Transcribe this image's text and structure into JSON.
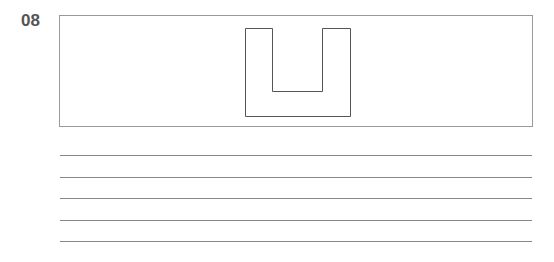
{
  "question": {
    "number": "08"
  },
  "figure": {
    "shape": "u-shape-outline",
    "stroke": "#555555"
  },
  "answer_lines": {
    "count": 5,
    "color": "#888888"
  }
}
